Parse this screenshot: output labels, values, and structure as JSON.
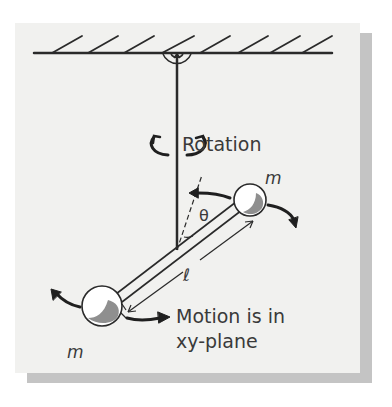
{
  "diagram": {
    "labels": {
      "rotation": "Rotation",
      "mass_top": "m",
      "mass_bottom": "m",
      "angle": "θ",
      "length": "ℓ",
      "motion_line1": "Motion is in",
      "motion_line2": "xy-plane"
    },
    "colors": {
      "background": "#f1f1ef",
      "shadow": "#c4c4c4",
      "ink": "#2a2a2a",
      "mass_shade": "#8f8f8f"
    }
  }
}
